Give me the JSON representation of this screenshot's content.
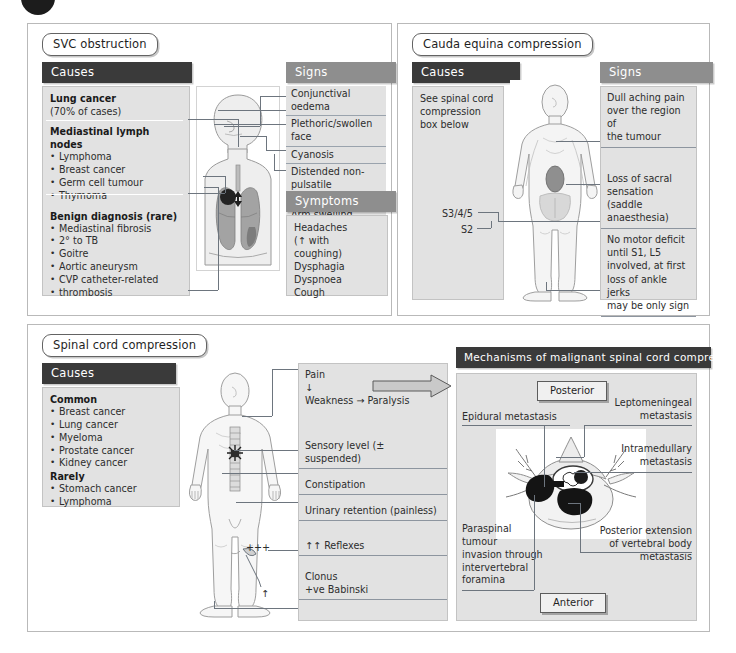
{
  "page": {
    "corner_mark": "dark-circle"
  },
  "svc": {
    "title": "SVC obstruction",
    "causes_header": "Causes",
    "signs_header": "Signs",
    "symptoms_header": "Symptoms",
    "causes": {
      "lung_cancer_title": "Lung cancer",
      "lung_cancer_sub": "(70% of cases)",
      "mediastinal_title": "Mediastinal lymph nodes",
      "mediastinal_items": [
        "Lymphoma",
        "Breast cancer",
        "Germ cell tumour",
        "Thymoma"
      ],
      "benign_title": "Benign diagnosis (rare)",
      "benign_items": [
        "Mediastinal fibrosis",
        "Goitre",
        "Aortic aneurysm",
        "CVP catheter-related"
      ],
      "benign_item1_cont": "2° to TB",
      "benign_item4_cont": "thrombosis"
    },
    "signs": [
      "Conjunctival oedema",
      "Plethoric/swollen face",
      "Cyanosis",
      "Distended non-pulsatile",
      "neck veins",
      "Arm swelling"
    ],
    "symptoms": [
      "Headaches",
      "(↑ with coughing)",
      "Dysphagia",
      "Dyspnoea",
      "Cough"
    ]
  },
  "cauda": {
    "title": "Cauda equina compression",
    "causes_header": "Causes",
    "signs_header": "Signs",
    "causes_text": [
      "See spinal cord",
      "compression",
      "box below"
    ],
    "signs_groups": [
      [
        "Dull aching pain",
        "over the region of",
        "the tumour"
      ],
      [
        "Loss of sacral",
        "sensation (saddle",
        "anaesthesia)"
      ],
      [
        "No motor deficit",
        "until S1, L5",
        "involved, at first",
        "loss of ankle jerks",
        "may be only sign"
      ]
    ],
    "figure_labels": {
      "s345": "S3/4/5",
      "s2": "S2"
    }
  },
  "spinal": {
    "title": "Spinal cord compression",
    "causes_header": "Causes",
    "causes": {
      "common_title": "Common",
      "common_items": [
        "Breast cancer",
        "Lung cancer",
        "Myeloma",
        "Prostate cancer",
        "Kidney cancer"
      ],
      "rarely_title": "Rarely",
      "rarely_items": [
        "Stomach cancer",
        "Lymphoma"
      ]
    },
    "signs_rows": [
      [
        "Pain",
        "↓",
        "Weakness → Paralysis"
      ],
      [
        "Sensory level (± suspended)"
      ],
      [
        "Constipation"
      ],
      [
        "Urinary retention (painless)"
      ],
      [
        "↑↑ Reflexes"
      ],
      [
        "Clonus",
        "+ve Babinski"
      ]
    ],
    "figure_labels": {
      "plus": "+++",
      "up_arrow": "↑"
    }
  },
  "mechanisms": {
    "header": "Mechanisms of malignant spinal cord compression",
    "posterior_label": "Posterior",
    "anterior_label": "Anterior",
    "labels": {
      "epidural": "Epidural metastasis",
      "leptomeningeal": [
        "Leptomeningeal",
        "metastasis"
      ],
      "intramedullary": [
        "Intramedullary",
        "metastasis"
      ],
      "posterior_extension": [
        "Posterior extension",
        "of vertebral body",
        "metastasis"
      ],
      "paraspinal": [
        "Paraspinal",
        "tumour",
        "invasion through",
        "intervertebral",
        "foramina"
      ]
    }
  },
  "colors": {
    "header_dark": "#3a3a3a",
    "header_grey": "#8e8e8e",
    "box_grey": "#e2e2e2",
    "line": "#6d757e",
    "lung": "#9b9b9b",
    "tumour": "#2b2b2b"
  }
}
